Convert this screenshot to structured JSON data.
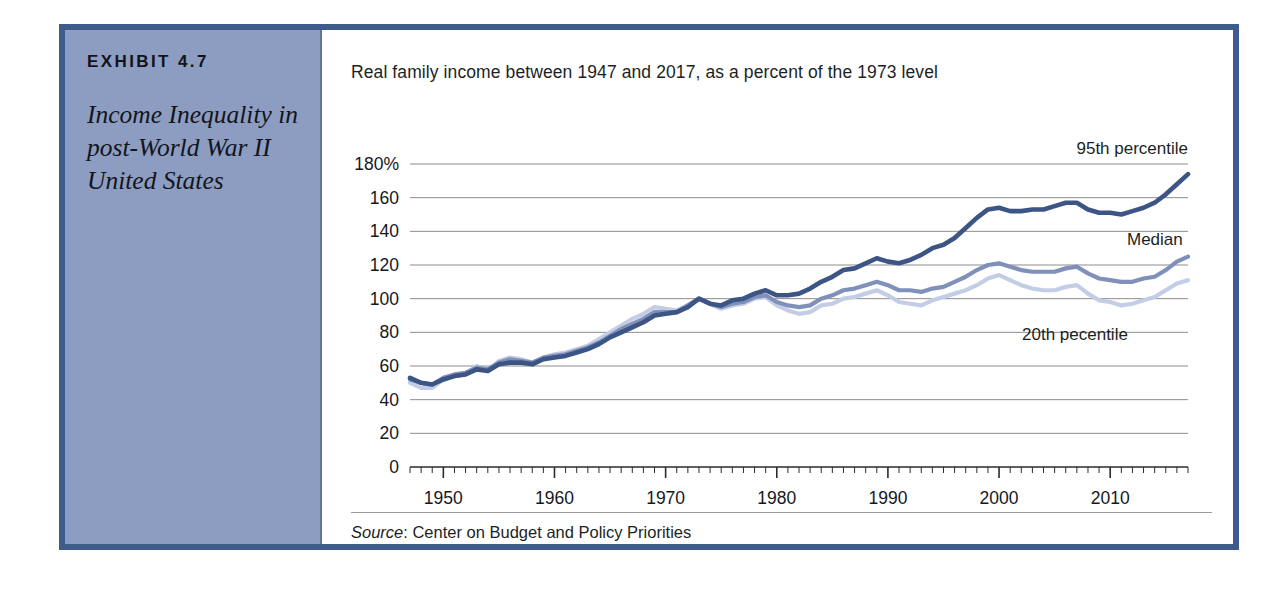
{
  "exhibit": {
    "label": "EXHIBIT 4.7",
    "title": "Income Inequality in post-World War II United States",
    "sidebar_color": "#8d9dc2",
    "border_color": "#3e5b8c"
  },
  "chart_header": {
    "subtitle": "Real family income between 1947 and 2017, as a percent of the 1973 level"
  },
  "footer": {
    "source_word": "Source",
    "source_text": ": Center on Budget and Policy Priorities"
  },
  "series_labels": {
    "p95": "95th percentile",
    "median": "Median",
    "p20": "20th pecentile"
  },
  "colors": {
    "p95": "#3d5584",
    "median": "#7f90ba",
    "p20": "#c3cee6",
    "gridline": "#8d8d8d",
    "axis": "#2b2b2b"
  },
  "chart_data": {
    "type": "line",
    "title": "Income Inequality in post-World War II United States",
    "subtitle": "Real family income between 1947 and 2017, as a percent of the 1973 level",
    "xlabel": "",
    "ylabel": "",
    "ylim": [
      0,
      180
    ],
    "xlim": [
      1947,
      2017
    ],
    "yticks": [
      0,
      20,
      40,
      60,
      80,
      100,
      120,
      140,
      160,
      180
    ],
    "ytick_labels": [
      "0",
      "20",
      "40",
      "60",
      "80",
      "100",
      "120",
      "140",
      "160",
      "180%"
    ],
    "xticks": [
      1950,
      1960,
      1970,
      1980,
      1990,
      2000,
      2010
    ],
    "xtick_labels": [
      "1950",
      "1960",
      "1970",
      "1980",
      "1990",
      "2000",
      "2010"
    ],
    "minor_xtick_interval": 1,
    "grid": "horizontal",
    "legend": "inline-right-labels",
    "source": "Center on Budget and Policy Priorities",
    "x": [
      1947,
      1948,
      1949,
      1950,
      1951,
      1952,
      1953,
      1954,
      1955,
      1956,
      1957,
      1958,
      1959,
      1960,
      1961,
      1962,
      1963,
      1964,
      1965,
      1966,
      1967,
      1968,
      1969,
      1970,
      1971,
      1972,
      1973,
      1974,
      1975,
      1976,
      1977,
      1978,
      1979,
      1980,
      1981,
      1982,
      1983,
      1984,
      1985,
      1986,
      1987,
      1988,
      1989,
      1990,
      1991,
      1992,
      1993,
      1994,
      1995,
      1996,
      1997,
      1998,
      1999,
      2000,
      2001,
      2002,
      2003,
      2004,
      2005,
      2006,
      2007,
      2008,
      2009,
      2010,
      2011,
      2012,
      2013,
      2014,
      2015,
      2016,
      2017
    ],
    "series": [
      {
        "name": "95th percentile",
        "color": "#3d5584",
        "values": [
          53,
          50,
          49,
          52,
          54,
          55,
          58,
          57,
          61,
          62,
          62,
          61,
          64,
          65,
          66,
          68,
          70,
          73,
          77,
          80,
          83,
          86,
          90,
          91,
          92,
          95,
          100,
          97,
          96,
          99,
          100,
          103,
          105,
          102,
          102,
          103,
          106,
          110,
          113,
          117,
          118,
          121,
          124,
          122,
          121,
          123,
          126,
          130,
          132,
          136,
          142,
          148,
          153,
          154,
          152,
          152,
          153,
          153,
          155,
          157,
          157,
          153,
          151,
          151,
          150,
          152,
          154,
          157,
          162,
          168,
          174
        ]
      },
      {
        "name": "Median",
        "color": "#7f90ba",
        "values": [
          52,
          50,
          49,
          53,
          55,
          56,
          59,
          58,
          62,
          64,
          63,
          62,
          65,
          66,
          67,
          69,
          71,
          74,
          78,
          82,
          85,
          88,
          92,
          92,
          92,
          96,
          100,
          97,
          95,
          97,
          98,
          101,
          102,
          98,
          96,
          95,
          96,
          100,
          102,
          105,
          106,
          108,
          110,
          108,
          105,
          105,
          104,
          106,
          107,
          110,
          113,
          117,
          120,
          121,
          119,
          117,
          116,
          116,
          116,
          118,
          119,
          115,
          112,
          111,
          110,
          110,
          112,
          113,
          117,
          122,
          125
        ]
      },
      {
        "name": "20th pecentile",
        "color": "#c3cee6",
        "values": [
          50,
          47,
          47,
          52,
          54,
          55,
          60,
          57,
          63,
          65,
          64,
          62,
          65,
          67,
          68,
          70,
          72,
          76,
          80,
          84,
          88,
          91,
          95,
          94,
          93,
          96,
          100,
          97,
          94,
          96,
          97,
          100,
          101,
          96,
          93,
          91,
          92,
          96,
          97,
          100,
          101,
          103,
          105,
          102,
          98,
          97,
          96,
          99,
          101,
          103,
          105,
          108,
          112,
          114,
          111,
          108,
          106,
          105,
          105,
          107,
          108,
          103,
          99,
          98,
          96,
          97,
          99,
          101,
          105,
          109,
          111
        ]
      }
    ]
  }
}
